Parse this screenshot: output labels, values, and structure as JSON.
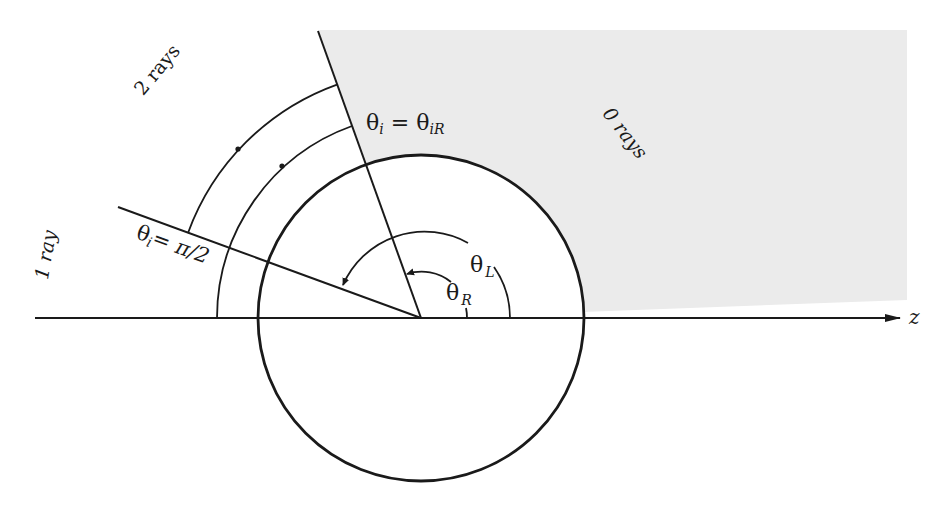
{
  "diagram": {
    "type": "ray-angle-geometry",
    "axis_label": "z",
    "region_labels": {
      "zero_rays": "0 rays",
      "one_ray": "1 ray",
      "two_rays": "2 rays"
    },
    "boundary_labels": {
      "theta_iR": {
        "lhs": "θ",
        "lhs_sub": "i",
        "eq": " = ",
        "rhs": "θ",
        "rhs_sub": "iR"
      },
      "theta_pi2": {
        "lhs": "θ",
        "lhs_sub": "i",
        "eq": "= π/2"
      }
    },
    "angle_labels": {
      "theta_L": {
        "sym": "θ",
        "sub": "L"
      },
      "theta_R": {
        "sym": "θ",
        "sub": "R"
      }
    },
    "geometry": {
      "center": [
        421,
        318
      ],
      "circle_radius": 163,
      "theta_iR_deg": 109.8,
      "theta_pi2_deg": 160,
      "arcs": [
        {
          "name": "outer-ray-arc",
          "r": 248,
          "from_deg": 109.8,
          "to_deg": 160
        },
        {
          "name": "middle-ray-arc",
          "r": 204,
          "from_deg": 109.8,
          "to_deg": 180
        },
        {
          "name": "theta-L-arc",
          "r": 89
        },
        {
          "name": "theta-R-arc",
          "r": 47
        }
      ]
    },
    "colors": {
      "ink": "#1a1a1a",
      "shaded_region": "#ebebeb",
      "background": "#ffffff"
    }
  }
}
